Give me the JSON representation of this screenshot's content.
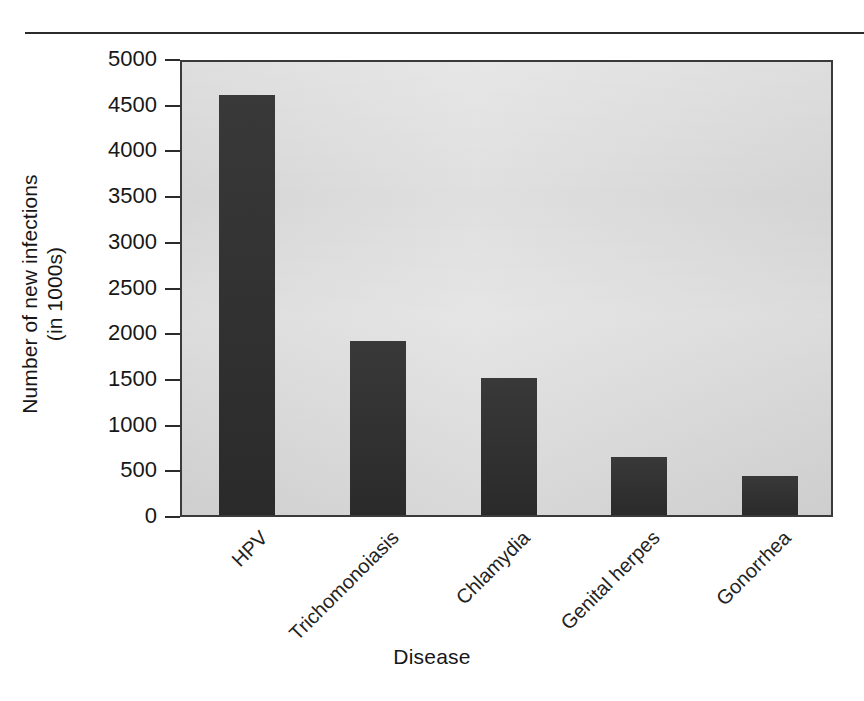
{
  "figure": {
    "top_rule": "horizontal-rule",
    "background_color": "#ffffff",
    "plot_background_color": "#dcdcdc",
    "bar_color": "#2e2e2e",
    "axis_color": "#2b2b2b"
  },
  "axes": {
    "y_title_line1": "Number of new infections",
    "y_title_line2": "(in 1000s)",
    "x_title": "Disease",
    "y_ticks": [
      "5000",
      "4500",
      "4000",
      "3500",
      "3000",
      "2500",
      "2000",
      "1500",
      "1000",
      "500",
      "0"
    ]
  },
  "chart_data": {
    "type": "bar",
    "title": "",
    "subtitle": "",
    "categories": [
      "HPV",
      "Trichomonoiasis",
      "Chlamydia",
      "Genital herpes",
      "Gonorrhea"
    ],
    "values": [
      4600,
      1900,
      1500,
      630,
      430
    ],
    "series": [
      {
        "name": "Number of new infections (in 1000s)",
        "values": [
          4600,
          1900,
          1500,
          630,
          430
        ]
      }
    ],
    "xlabel": "Disease",
    "ylabel": "Number of new infections (in 1000s)",
    "ylim": [
      0,
      5000
    ],
    "ytick_values": [
      0,
      500,
      1000,
      1500,
      2000,
      2500,
      3000,
      3500,
      4000,
      4500,
      5000
    ],
    "ytick_labels": [
      "0",
      "500",
      "1000",
      "1500",
      "2000",
      "2500",
      "3000",
      "3500",
      "4000",
      "4500",
      "5000"
    ],
    "grid": false,
    "legend": false,
    "legend_position": "none",
    "bar_color": "#2e2e2e",
    "plot_background": "#dcdcdc",
    "xtick_label_rotation": -45,
    "annotations": []
  }
}
